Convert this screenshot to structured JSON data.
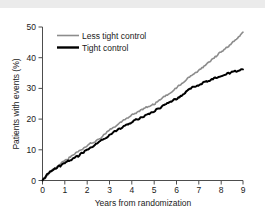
{
  "chart_data": {
    "type": "line",
    "title": "",
    "subtitle": "",
    "xlabel": "Years from randomization",
    "ylabel": "Patients with events (%)",
    "xlim": [
      0,
      9
    ],
    "ylim": [
      0,
      50
    ],
    "xticks": [
      "0",
      "1",
      "2",
      "3",
      "4",
      "5",
      "6",
      "7",
      "8",
      "9"
    ],
    "yticks": [
      "0",
      "10",
      "20",
      "30",
      "40",
      "50"
    ],
    "grid": false,
    "legend_position": "top-left",
    "colors": {
      "less_tight_control": "#8c8c8c",
      "tight_control": "#000000",
      "axis": "#4d4d4d",
      "text": "#1a1a1a",
      "background": "#ffffff",
      "top_strip": "#ebebeb"
    },
    "series": [
      {
        "name": "Less tight control",
        "color": "#8c8c8c",
        "x": [
          0,
          0.1,
          0.2,
          0.3,
          0.4,
          0.5,
          0.6,
          0.7,
          0.8,
          0.9,
          1.0,
          1.1,
          1.2,
          1.3,
          1.4,
          1.5,
          1.6,
          1.7,
          1.8,
          1.9,
          2.0,
          2.1,
          2.2,
          2.3,
          2.4,
          2.5,
          2.6,
          2.7,
          2.8,
          2.9,
          3.0,
          3.1,
          3.2,
          3.3,
          3.4,
          3.5,
          3.6,
          3.7,
          3.8,
          3.9,
          4.0,
          4.1,
          4.2,
          4.3,
          4.4,
          4.5,
          4.6,
          4.7,
          4.8,
          4.9,
          5.0,
          5.1,
          5.2,
          5.3,
          5.4,
          5.5,
          5.6,
          5.7,
          5.8,
          5.9,
          6.0,
          6.1,
          6.2,
          6.3,
          6.4,
          6.5,
          6.6,
          6.7,
          6.8,
          6.9,
          7.0,
          7.1,
          7.2,
          7.3,
          7.4,
          7.5,
          7.6,
          7.7,
          7.8,
          7.9,
          8.0,
          8.1,
          8.2,
          8.3,
          8.4,
          8.5,
          8.6,
          8.7,
          8.8,
          8.9,
          9.0
        ],
        "values": [
          0.0,
          0.8,
          1.6,
          2.4,
          3.1,
          3.8,
          4.3,
          4.8,
          5.3,
          5.9,
          6.4,
          6.9,
          7.4,
          7.9,
          8.4,
          8.9,
          9.4,
          9.8,
          10.2,
          10.7,
          11.2,
          11.8,
          12.2,
          12.6,
          13.0,
          13.4,
          13.9,
          14.6,
          15.2,
          15.7,
          16.3,
          16.9,
          17.4,
          17.9,
          18.3,
          18.8,
          19.3,
          19.8,
          20.2,
          20.7,
          21.2,
          21.6,
          22.0,
          22.4,
          22.8,
          23.2,
          23.6,
          24.0,
          24.3,
          24.6,
          24.9,
          25.4,
          25.9,
          26.4,
          26.9,
          27.4,
          27.9,
          28.4,
          29.0,
          29.6,
          30.2,
          30.8,
          31.4,
          32.0,
          32.6,
          33.2,
          33.8,
          34.3,
          34.8,
          35.3,
          35.8,
          36.4,
          37.0,
          37.6,
          38.2,
          38.8,
          39.4,
          40.0,
          40.6,
          41.2,
          41.8,
          42.4,
          43.0,
          43.6,
          44.2,
          44.8,
          45.4,
          46.0,
          46.6,
          47.4,
          48.3
        ]
      },
      {
        "name": "Tight control",
        "color": "#000000",
        "x": [
          0,
          0.1,
          0.2,
          0.3,
          0.4,
          0.5,
          0.6,
          0.7,
          0.8,
          0.9,
          1.0,
          1.1,
          1.2,
          1.3,
          1.4,
          1.5,
          1.6,
          1.7,
          1.8,
          1.9,
          2.0,
          2.1,
          2.2,
          2.3,
          2.4,
          2.5,
          2.6,
          2.7,
          2.8,
          2.9,
          3.0,
          3.1,
          3.2,
          3.3,
          3.4,
          3.5,
          3.6,
          3.7,
          3.8,
          3.9,
          4.0,
          4.1,
          4.2,
          4.3,
          4.4,
          4.5,
          4.6,
          4.7,
          4.8,
          4.9,
          5.0,
          5.1,
          5.2,
          5.3,
          5.4,
          5.5,
          5.6,
          5.7,
          5.8,
          5.9,
          6.0,
          6.1,
          6.2,
          6.3,
          6.4,
          6.5,
          6.6,
          6.7,
          6.8,
          6.9,
          7.0,
          7.1,
          7.2,
          7.3,
          7.4,
          7.5,
          7.6,
          7.7,
          7.8,
          7.9,
          8.0,
          8.1,
          8.2,
          8.3,
          8.4,
          8.5,
          8.6,
          8.7,
          8.8,
          8.9,
          9.0
        ],
        "values": [
          0.0,
          0.9,
          1.8,
          2.6,
          3.2,
          3.6,
          4.0,
          4.4,
          4.8,
          5.2,
          5.6,
          6.0,
          6.4,
          6.8,
          7.2,
          7.6,
          8.0,
          8.5,
          9.0,
          9.5,
          10.0,
          10.5,
          11.0,
          11.4,
          11.8,
          12.2,
          12.7,
          13.2,
          13.7,
          14.2,
          14.7,
          15.2,
          15.7,
          16.2,
          16.6,
          17.0,
          17.4,
          17.8,
          18.2,
          18.6,
          19.0,
          19.4,
          19.8,
          20.1,
          20.4,
          20.7,
          21.0,
          21.4,
          21.8,
          22.2,
          22.6,
          23.0,
          23.4,
          23.8,
          24.2,
          24.6,
          25.0,
          25.4,
          25.8,
          26.2,
          26.6,
          27.0,
          27.4,
          27.8,
          28.6,
          29.4,
          29.9,
          30.3,
          30.6,
          30.9,
          31.1,
          31.4,
          31.7,
          32.0,
          32.3,
          32.6,
          32.9,
          33.2,
          33.5,
          33.8,
          34.0,
          34.3,
          34.6,
          34.8,
          35.0,
          35.2,
          35.4,
          35.6,
          35.8,
          36.0,
          36.2
        ]
      }
    ]
  },
  "legend": {
    "items": [
      {
        "label": "Less tight control",
        "color": "#8c8c8c"
      },
      {
        "label": "Tight control",
        "color": "#000000"
      }
    ]
  },
  "axes": {
    "x_title": "Years from randomization",
    "y_title": "Patients with events (%)"
  }
}
